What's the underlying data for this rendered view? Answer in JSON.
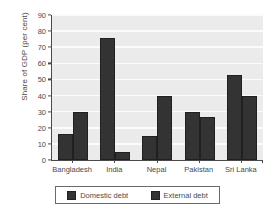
{
  "chart_data": {
    "type": "bar",
    "title": "",
    "subtitle": "",
    "xlabel": "",
    "ylabel": "Share of GDP (per cent)",
    "categories": [
      "Bangladesh",
      "India",
      "Nepal",
      "Pakistan",
      "Sri Lanka"
    ],
    "series": [
      {
        "name": "Domestic debt",
        "color": "#333333",
        "values": [
          16,
          76,
          15,
          30,
          53
        ]
      },
      {
        "name": "External debt",
        "color": "#333333",
        "values": [
          30,
          5,
          40,
          27,
          40
        ]
      }
    ],
    "ylim": [
      0,
      90
    ],
    "ytick_labels": [
      "0",
      "10",
      "20",
      "30",
      "40",
      "50",
      "60",
      "70",
      "80",
      "90"
    ],
    "ytick_values": [
      0,
      10,
      20,
      30,
      40,
      50,
      60,
      70,
      80,
      90
    ],
    "grid": true,
    "grid_color": "#fbfbfb",
    "plot_background": "#ebebeb",
    "axis_color": "#4a4a4a",
    "legend_position": "bottom",
    "legend_entries": [
      "Domestic debt",
      "External debt"
    ]
  }
}
